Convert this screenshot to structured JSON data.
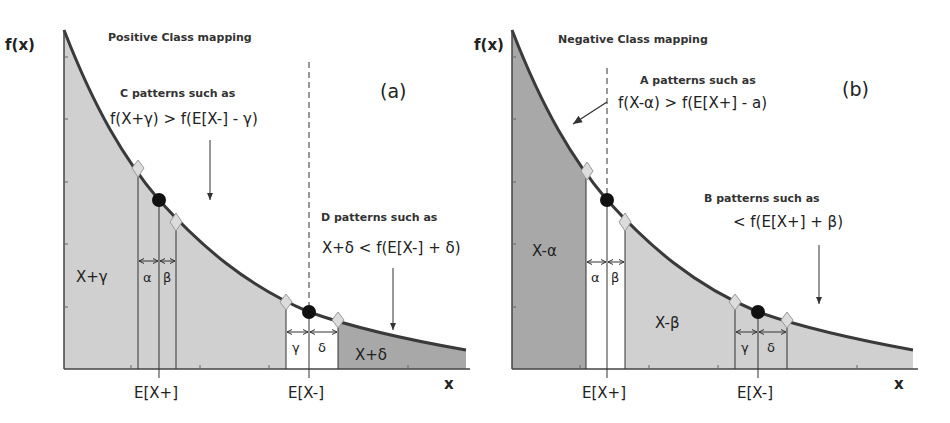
{
  "colors": {
    "light_fill": "#d0d0d0",
    "dark_fill": "#a8a8a8",
    "curve": "#3a3a3a",
    "axis": "#444444",
    "marker_circle": "#111111",
    "marker_diamond": "#dcdcdc"
  },
  "panels": [
    {
      "id": "a",
      "tag": "(a)",
      "title": "Positive Class mapping",
      "y_axis_label": "f(x)",
      "x_axis_label": "x",
      "x_tick_labels": [
        "E[X+]",
        "E[X-]"
      ],
      "annotation_1": {
        "heading": "C patterns such as",
        "formula": "f(X+γ) > f(E[X-] - γ)"
      },
      "annotation_2": {
        "heading": "D patterns  such as",
        "formula": "X+δ < f(E[X-] + δ)"
      },
      "regions": {
        "left": "X+γ",
        "right": "X+δ"
      },
      "interval_labels": [
        "α",
        "β",
        "γ",
        "δ"
      ]
    },
    {
      "id": "b",
      "tag": "(b)",
      "title": "Negative Class mapping",
      "y_axis_label": "f(x)",
      "x_axis_label": "x",
      "x_tick_labels": [
        "E[X+]",
        "E[X-]"
      ],
      "annotation_1": {
        "heading": "A patterns such as",
        "formula": "f(X-α) > f(E[X+] - a)"
      },
      "annotation_2": {
        "heading": "B patterns such as",
        "formula": "< f(E[X+] + β)"
      },
      "regions": {
        "left": "X-α",
        "right": "X-β"
      },
      "interval_labels": [
        "α",
        "β",
        "γ",
        "δ"
      ]
    }
  ]
}
